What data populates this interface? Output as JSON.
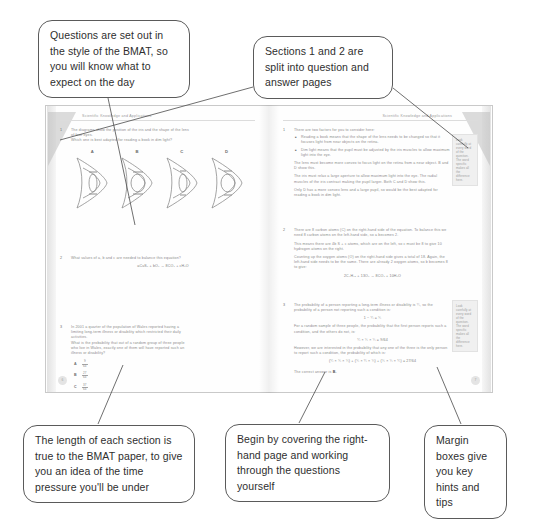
{
  "callouts": [
    {
      "id": "questions-style",
      "text": "Questions are set out in the style of the BMAT, so you will know what to expect on the day"
    },
    {
      "id": "sections-split",
      "text": "Sections 1 and 2 are split into question and answer pages"
    },
    {
      "id": "section-length",
      "text": "The length of each section is true to the BMAT paper, to give you an idea of the time pressure you'll be under"
    },
    {
      "id": "cover-page",
      "text": "Begin by covering the right-hand page and working through the questions yourself"
    },
    {
      "id": "margin-boxes",
      "text": "Margin boxes give you key hints and tips"
    }
  ],
  "book": {
    "left_page": {
      "running_head": "Scientific Knowledge and Applications",
      "folio": "6",
      "questions": [
        {
          "number": "1",
          "stem_line_1": "The diagrams show the position of the iris and the shape of the lens",
          "stem_line_2": "of four eyes.",
          "stem_line_3": "Which one is best adapted for reading a book in dim light?",
          "options": [
            "A",
            "B",
            "C",
            "D"
          ]
        },
        {
          "number": "2",
          "stem_line_1": "What values of a, b and c are needed to balance this equation?",
          "equation": "aCuS₂ + bO₂ → 8CO₂ + cH₂O"
        },
        {
          "number": "3",
          "stem_line_1": "In 2001 a quarter of the population of Wales reported having a",
          "stem_line_2": "limiting long-term illness or disability which restricted their daily",
          "stem_line_3": "activities.",
          "stem_line_4": "What is the probability that out of a random group of three people",
          "stem_line_5": "who live in Wales, exactly one of them will have reported such an",
          "stem_line_6": "illness or disability?",
          "choices": [
            {
              "letter": "A",
              "numerator": "9",
              "denominator": "64"
            },
            {
              "letter": "B",
              "numerator": "27",
              "denominator": "64"
            },
            {
              "letter": "C",
              "numerator": "37",
              "denominator": "64"
            },
            {
              "letter": "D",
              "numerator": "1",
              "denominator": "4"
            }
          ]
        }
      ]
    },
    "right_page": {
      "running_head": "Scientific Knowledge and Applications",
      "folio": "7",
      "margin_box_top": "Look carefully at every word of the question. The word specific makes all the difference here.",
      "margin_box_bottom": "Look carefully at every word of the question. The word specific makes all the difference here.",
      "answers": [
        {
          "number": "1",
          "intro": "There are two factors for you to consider here:",
          "bullets": [
            "Reading a book means that the shape of the lens needs to be changed so that it focuses light from near objects on the retina.",
            "Dim light means that the pupil must be adjusted by the iris muscles to allow maximum light into the eye."
          ],
          "para_1": "The lens must become more convex to focus light on the retina from a near object. B and D show this.",
          "para_2": "The iris must relax a large aperture to allow maximum light into the eye. The radial muscles of the iris contract making the pupil larger. Both C and D show this.",
          "para_3": "Only D has a more convex lens and a large pupil, so would be the best adapted for reading a book in dim light."
        },
        {
          "number": "2",
          "para_1": "There are 8 carbon atoms (C) on the right-hand side of the equation. To balance this we need 8 carbon atoms on the left-hand side, so a becomes 2.",
          "para_2": "This means there are 4b S + c atoms, which are on the left, so c must be 8 to give 10 hydrogen atoms on the right.",
          "para_3": "Counting up the oxygen atoms (O) on the right-hand side gives a total of 18. Again, the left-hand side needs to be the same. There are already 2 oxygen atoms, so b becomes 8 to give:",
          "equation": "2C₄H₁₀ + 13O₂ → 8CO₂ + 10H₂O"
        },
        {
          "number": "3",
          "para_1": "The probability of a person reporting a long-term illness or disability is ¼, so the probability of a person not reporting such a condition is:",
          "equation_1": "1 − ¼ = ¾",
          "para_2": "For a random sample of three people, the probability that the first person reports such a condition, and the others do not, is:",
          "equation_2": "¼ × ¾ × ¾ = 9/64",
          "para_3": "However, we are interested in the probability that any one of the three is the only person to report such a condition, the probability of which is:",
          "equation_3": "(¼ × ¾ × ¾) + (¾ × ¼ × ¾) + (¾ × ¾ × ¼) = 27/64",
          "conclusion_prefix": "The correct answer is ",
          "conclusion_answer": "B."
        }
      ]
    }
  }
}
